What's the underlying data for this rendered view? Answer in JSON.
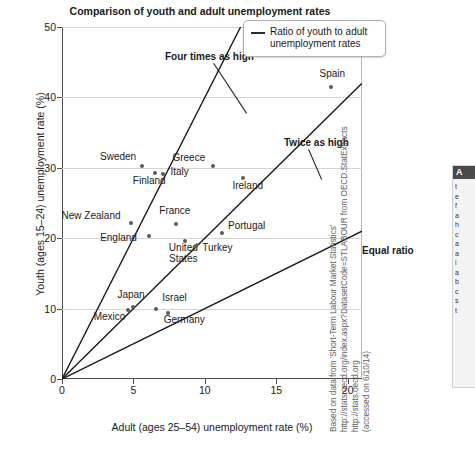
{
  "chart_data": {
    "type": "scatter",
    "title": "Comparison of youth and adult unemployment rates",
    "xlabel": "Adult (ages 25–54) unemployment rate (%)",
    "ylabel": "Youth (ages 15–24) unemployment rate (%)",
    "xlim": [
      0,
      21
    ],
    "ylim": [
      0,
      50
    ],
    "xticks": [
      0,
      5,
      10,
      15,
      20
    ],
    "yticks": [
      0,
      10,
      20,
      30,
      40,
      50
    ],
    "grid": "horizontal",
    "legend_position": "top-right",
    "points": [
      {
        "label": "Mexico",
        "x": 4.6,
        "y": 9.8,
        "label_dx": -34,
        "label_dy": 12
      },
      {
        "label": "Japan",
        "x": 5.0,
        "y": 10.2,
        "label_dx": -16,
        "label_dy": -7
      },
      {
        "label": "Israel",
        "x": 6.6,
        "y": 10.0,
        "label_dx": 6,
        "label_dy": -6
      },
      {
        "label": "Germany",
        "x": 7.4,
        "y": 9.4,
        "label_dx": -4,
        "label_dy": 12
      },
      {
        "label": "England",
        "x": 6.1,
        "y": 20.3,
        "label_dx": -49,
        "label_dy": 7
      },
      {
        "label": "New Zealand",
        "x": 4.8,
        "y": 22.2,
        "label_dx": -69,
        "label_dy": -2
      },
      {
        "label": "France",
        "x": 8.0,
        "y": 22.0,
        "label_dx": -17,
        "label_dy": -8
      },
      {
        "label": "United\nStates",
        "x": 8.6,
        "y": 19.6,
        "label_dx": -16,
        "label_dy": 12
      },
      {
        "label": "Turkey",
        "x": 9.4,
        "y": 18.9,
        "label_dx": 6,
        "label_dy": 7
      },
      {
        "label": "Portugal",
        "x": 11.2,
        "y": 20.7,
        "label_dx": 6,
        "label_dy": -2
      },
      {
        "label": "Finland",
        "x": 6.5,
        "y": 29.2,
        "label_dx": -22,
        "label_dy": 13
      },
      {
        "label": "Italy",
        "x": 7.1,
        "y": 29.1,
        "label_dx": 7,
        "label_dy": 3
      },
      {
        "label": "Sweden",
        "x": 5.6,
        "y": 30.2,
        "label_dx": -42,
        "label_dy": -4
      },
      {
        "label": "Greece",
        "x": 10.6,
        "y": 30.2,
        "label_dx": -41,
        "label_dy": -3
      },
      {
        "label": "Ireland",
        "x": 12.7,
        "y": 28.6,
        "label_dx": -11,
        "label_dy": 13
      },
      {
        "label": "Spain",
        "x": 18.8,
        "y": 41.5,
        "label_dx": -11,
        "label_dy": -8
      }
    ],
    "reference_lines": [
      {
        "name": "Four times as high",
        "slope": 4,
        "label_x_px": 103,
        "label_y_px": 24,
        "leader_from_x": 152,
        "leader_from_y": 36,
        "leader_to_x": 185,
        "leader_to_y": 86
      },
      {
        "name": "Twice as high",
        "slope": 2,
        "label_x_px": 222,
        "label_y_px": 110,
        "leader_from_x": 247,
        "leader_from_y": 122,
        "leader_to_x": 260,
        "leader_to_y": 152
      },
      {
        "name": "Equal ratio",
        "slope": 1,
        "label_x_px": 300,
        "label_y_px": 218,
        "leader_from_x": 0,
        "leader_from_y": 0,
        "leader_to_x": 0,
        "leader_to_y": 0
      }
    ]
  },
  "legend": {
    "label": "Ratio of youth to adult unemployment rates"
  },
  "source": {
    "line1": "Based on data from 'Short-Term Labour Market Statistics'",
    "line2": "http://stats.oecd.org/index.aspx?DatasetCode=STLABOUR from OECD.StatExtracts http://stats.oecd.org",
    "line3": "(accessed on 6/10/14)"
  },
  "sidebar": {
    "header": "A",
    "lines": [
      "t",
      "e",
      "f",
      "a",
      "h",
      "c",
      "a",
      "a",
      "i",
      "a",
      "b",
      "c",
      "s",
      "t"
    ]
  }
}
